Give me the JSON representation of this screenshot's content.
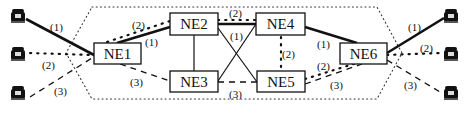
{
  "diagram": {
    "type": "network-protection-paths",
    "nodes": [
      {
        "id": "NE1",
        "label": "NE1"
      },
      {
        "id": "NE2",
        "label": "NE2"
      },
      {
        "id": "NE3",
        "label": "NE3"
      },
      {
        "id": "NE4",
        "label": "NE4"
      },
      {
        "id": "NE5",
        "label": "NE5"
      },
      {
        "id": "NE6",
        "label": "NE6"
      }
    ],
    "terminals": {
      "left": [
        {
          "icon": "telephone-icon",
          "path": "(1)"
        },
        {
          "icon": "telephone-icon",
          "path": "(2)"
        },
        {
          "icon": "telephone-icon",
          "path": "(3)"
        }
      ],
      "right": [
        {
          "icon": "telephone-icon",
          "path": "(1)"
        },
        {
          "icon": "telephone-icon",
          "path": "(2)"
        },
        {
          "icon": "telephone-icon",
          "path": "(3)"
        }
      ]
    },
    "path_styles": {
      "(1)": "solid-thick",
      "(2)": "dotted",
      "(3)": "dashed"
    },
    "labels": {
      "left_p1": "(1)",
      "left_p2": "(2)",
      "left_p3": "(3)",
      "ne1_ne2_p2": "(2)",
      "ne1_ne2_p1": "(1)",
      "ne1_ne5_p3": "(3)",
      "ne2_ne4_p2": "(2)",
      "cross_p1": "(1)",
      "ne4_ne5_p2": "(2)",
      "ne3_ne5_p3": "(3)",
      "ne4_ne6_p1": "(1)",
      "ne5_ne6_p2": "(2)",
      "ne5_ne6_p3": "(3)",
      "right_p1": "(1)",
      "right_p2": "(2)",
      "right_p3": "(3)"
    },
    "links": [
      {
        "from": "NE2",
        "to": "NE3",
        "style": "solid-thin"
      },
      {
        "from": "NE2",
        "to": "NE5",
        "style": "solid-thin"
      },
      {
        "from": "NE3",
        "to": "NE4",
        "style": "solid-thin"
      },
      {
        "from": "NE2",
        "to": "NE4",
        "style": "solid-thick"
      },
      {
        "from": "NE1",
        "to": "NE2",
        "style": "solid-thick"
      },
      {
        "from": "NE4",
        "to": "NE6",
        "style": "solid-thick"
      }
    ],
    "colors": {
      "ink": "#111111",
      "background": "#ffffff"
    }
  }
}
